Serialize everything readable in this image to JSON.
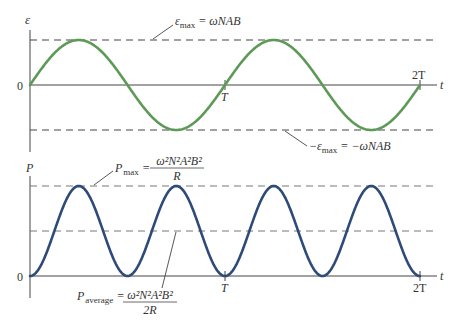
{
  "top_plot": {
    "y_axis_label": "ε",
    "x_axis_label": "t",
    "origin_label": "0",
    "tick_labels": [
      "T",
      "2T"
    ],
    "curve_color": "#5e9a57",
    "dashed_color": "#444444",
    "max_annotation": {
      "lhs_symbol": "ε",
      "lhs_sub": "max",
      "rhs": "= ωNAB"
    },
    "min_annotation": {
      "lhs_symbol": "−ε",
      "lhs_sub": "max",
      "rhs": "= −ωNAB"
    }
  },
  "bottom_plot": {
    "y_axis_label": "P",
    "x_axis_label": "t",
    "origin_label": "0",
    "tick_labels": [
      "T",
      "2T"
    ],
    "curve_color": "#2e4a78",
    "dashed_color": "#777777",
    "max_annotation": {
      "lhs_symbol": "P",
      "lhs_sub": "max",
      "equals": "=",
      "numerator": "ω²N²A²B²",
      "denominator": "R"
    },
    "average_annotation": {
      "lhs_symbol": "P",
      "lhs_sub": "average",
      "equals": "=",
      "numerator": "ω²N²A²B²",
      "denominator": "2R"
    }
  },
  "chart_data": [
    {
      "type": "line",
      "title": "",
      "xlabel": "t",
      "ylabel": "ε",
      "series": [
        {
          "name": "ε(t) = ε_max sin(2πt/T)",
          "function": "sin",
          "periods": 2
        }
      ],
      "x_ticks": [
        "0",
        "T",
        "2T"
      ],
      "y_ref_lines": [
        {
          "label": "ε_max = ωNAB",
          "value": 1
        },
        {
          "label": "−ε_max = −ωNAB",
          "value": -1
        }
      ],
      "ylim": [
        -1,
        1
      ]
    },
    {
      "type": "line",
      "title": "",
      "xlabel": "t",
      "ylabel": "P",
      "series": [
        {
          "name": "P(t) = P_max sin²(2πt/T)",
          "function": "sin^2",
          "periods": 2,
          "peaks": 4
        }
      ],
      "x_ticks": [
        "0",
        "T",
        "2T"
      ],
      "y_ref_lines": [
        {
          "label": "P_max = ω²N²A²B²/R",
          "value": 1
        },
        {
          "label": "P_average = ω²N²A²B²/2R",
          "value": 0.5
        }
      ],
      "ylim": [
        0,
        1
      ]
    }
  ]
}
